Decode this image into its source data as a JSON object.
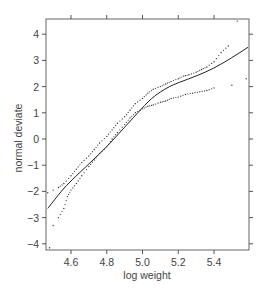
{
  "chart_data": {
    "type": "scatter",
    "title": "",
    "xlabel": "log weight",
    "ylabel": "normal deviate",
    "xlim": [
      4.46,
      5.596
    ],
    "ylim": [
      -4.2,
      4.5
    ],
    "x_ticks": [
      4.6,
      4.8,
      5.0,
      5.2,
      5.4
    ],
    "x_tick_labels": [
      "4.6",
      "4.8",
      "5.0",
      "5.2",
      "5.4"
    ],
    "y_ticks": [
      -4,
      -3,
      -2,
      -1,
      0,
      1,
      2,
      3,
      4
    ],
    "y_tick_labels": [
      "−4",
      "−3",
      "−2",
      "−1",
      "0",
      "1",
      "2",
      "3",
      "4"
    ],
    "grid": false,
    "legend": null,
    "series": [
      {
        "name": "fitted curve",
        "style": "solid-line",
        "x": [
          4.47,
          4.55,
          4.6,
          4.7,
          4.8,
          4.9,
          5.0,
          5.05,
          5.1,
          5.15,
          5.2,
          5.3,
          5.4,
          5.5,
          5.59
        ],
        "y": [
          -2.65,
          -1.95,
          -1.6,
          -0.95,
          -0.3,
          0.45,
          1.2,
          1.55,
          1.8,
          2.0,
          2.15,
          2.4,
          2.7,
          3.1,
          3.5
        ]
      },
      {
        "name": "upper envelope points",
        "style": "dots",
        "x": [
          4.47,
          4.5,
          4.53,
          4.56,
          4.6,
          4.63,
          4.66,
          4.7,
          4.73,
          4.76,
          4.8,
          4.83,
          4.86,
          4.9,
          4.93,
          4.96,
          5.0,
          5.03,
          5.06,
          5.1,
          5.13,
          5.16,
          5.2,
          5.23,
          5.26,
          5.3,
          5.33,
          5.36,
          5.4,
          5.44,
          5.48,
          5.53
        ],
        "y": [
          -2.05,
          -1.95,
          -1.85,
          -1.7,
          -1.4,
          -1.15,
          -0.9,
          -0.65,
          -0.4,
          -0.15,
          0.1,
          0.35,
          0.6,
          0.85,
          1.1,
          1.35,
          1.55,
          1.75,
          1.9,
          2.0,
          2.1,
          2.2,
          2.3,
          2.4,
          2.45,
          2.55,
          2.65,
          2.75,
          2.95,
          3.3,
          3.55,
          4.5
        ]
      },
      {
        "name": "lower envelope points",
        "style": "dots",
        "x": [
          4.48,
          4.5,
          4.53,
          4.56,
          4.58,
          4.6,
          4.63,
          4.66,
          4.7,
          4.73,
          4.76,
          4.8,
          4.83,
          4.86,
          4.9,
          4.93,
          4.96,
          5.0,
          5.03,
          5.06,
          5.1,
          5.13,
          5.16,
          5.2,
          5.24,
          5.28,
          5.32,
          5.36,
          5.4,
          5.5,
          5.58
        ],
        "y": [
          -4.15,
          -3.3,
          -3.0,
          -2.65,
          -2.2,
          -1.95,
          -1.7,
          -1.4,
          -1.05,
          -0.8,
          -0.55,
          -0.3,
          0.0,
          0.25,
          0.55,
          0.8,
          1.0,
          1.15,
          1.25,
          1.3,
          1.4,
          1.45,
          1.55,
          1.6,
          1.7,
          1.75,
          1.8,
          1.85,
          1.95,
          2.05,
          2.3
        ]
      }
    ]
  },
  "axes": {
    "xlabel": "log weight",
    "ylabel": "normal deviate"
  },
  "colors": {
    "axis": "#555555",
    "line": "#222222",
    "points": "#333333",
    "text": "#444444"
  }
}
